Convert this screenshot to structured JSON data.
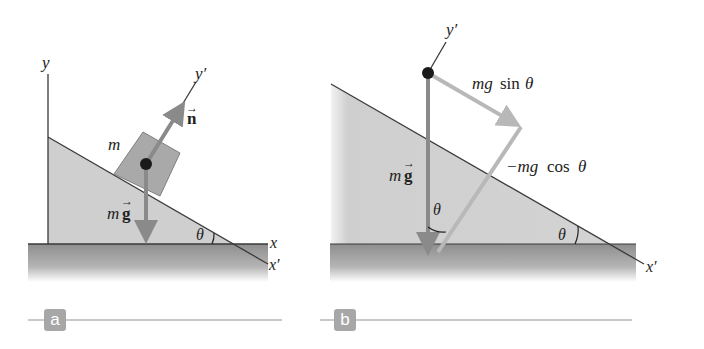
{
  "figure": {
    "panels": [
      {
        "label": "a",
        "axes": {
          "y": "y",
          "y_prime": "y′",
          "x": "x",
          "x_prime": "x′"
        },
        "mass_label": "m",
        "normal_force": {
          "symbol": "n",
          "arrow": "→"
        },
        "gravity_force": {
          "prefix": "m",
          "symbol": "g",
          "arrow": "→"
        },
        "angle_label": "θ"
      },
      {
        "label": "b",
        "axes": {
          "y_prime": "y′",
          "x_prime": "x′"
        },
        "gravity_force": {
          "prefix": "m",
          "symbol": "g",
          "arrow": "→"
        },
        "parallel_component": {
          "prefix": "mg",
          "func": "sin",
          "angle": "θ"
        },
        "perpendicular_component": {
          "prefix": "−mg",
          "func": "cos",
          "angle": "θ"
        },
        "angle_label_vertical": "θ",
        "angle_label_incline": "θ"
      }
    ],
    "colors": {
      "incline_fill": "#cfcfcf",
      "ground_fill": "#9d9d9d",
      "block_fill": "#a9a9a9",
      "arrow_dark": "#8a8a8a",
      "arrow_light": "#b8b8b8",
      "line": "#3a3a3a",
      "dot": "#1a1a1a",
      "badge_bg": "#a7a7a7"
    }
  }
}
